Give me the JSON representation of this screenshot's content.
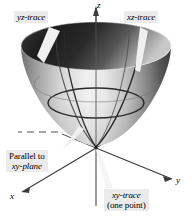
{
  "figure": {
    "background_color": "#ffffff",
    "surface": {
      "name": "elliptic-paraboloid",
      "vertex_label": "origin",
      "shading": "grayscale gradient, dark on upper-left rim and right flank, light center"
    },
    "axes": {
      "z": {
        "label": "z",
        "direction": "up"
      },
      "y": {
        "label": "y",
        "direction": "lower-right"
      },
      "x": {
        "label": "x",
        "direction": "lower-left"
      }
    },
    "callouts": {
      "yz_trace": {
        "label": "yz-trace",
        "italic_part": "yz"
      },
      "xz_trace": {
        "label": "xz-trace",
        "italic_part": "xz"
      },
      "parallel_xy": {
        "line1": "Parallel to",
        "line2": "xy-plane"
      },
      "xy_trace": {
        "line1": "xy-trace",
        "line2": "(one point)"
      }
    },
    "colors": {
      "callout_background": "#ebebeb",
      "text": "#000000",
      "axis_line": "#3a3a3a",
      "trace_curve": "#2b2b2b",
      "leader_line": "#f2f2f2"
    }
  }
}
